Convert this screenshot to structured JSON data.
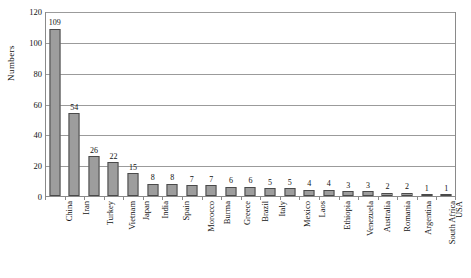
{
  "chart_data": {
    "type": "bar",
    "title": "",
    "xlabel": "",
    "ylabel": "Numbers",
    "ylim": [
      0,
      120
    ],
    "y_ticks": [
      0,
      20,
      40,
      60,
      80,
      100,
      120
    ],
    "grid": true,
    "legend": "none",
    "orientation": "vertical",
    "bar_color": "#9d9d9d",
    "bar_border_color": "#4a4a4a",
    "value_labels_shown": true,
    "x_label_rotation_deg": -90,
    "categories": [
      "China",
      "Iran",
      "Turkey",
      "Vietnam",
      "Japan",
      "India",
      "Spain",
      "Morocco",
      "Burma",
      "Greece",
      "Brazil",
      "Italy",
      "Mexico",
      "Laos",
      "Ethiopia",
      "Venezuela",
      "Australia",
      "Romania",
      "Argentina",
      "South Africa",
      "USA"
    ],
    "values": [
      109,
      54,
      26,
      22,
      15,
      8,
      8,
      7,
      7,
      6,
      6,
      5,
      5,
      4,
      4,
      3,
      3,
      2,
      2,
      1,
      1
    ]
  }
}
